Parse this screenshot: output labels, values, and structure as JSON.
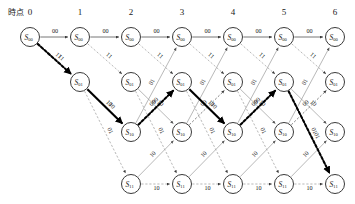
{
  "diagram": {
    "title_label": "時点",
    "type": "trellis",
    "columns": [
      "0",
      "1",
      "2",
      "3",
      "4",
      "5",
      "6"
    ],
    "column_x": [
      30,
      80,
      131,
      182,
      233,
      284,
      335
    ],
    "row_y": [
      37,
      82,
      132,
      184
    ],
    "states": [
      {
        "id": "s00",
        "base": "S",
        "sub": "00",
        "row": 0,
        "first_col": 0
      },
      {
        "id": "s01",
        "base": "S",
        "sub": "01",
        "row": 1,
        "first_col": 1
      },
      {
        "id": "s10",
        "base": "S",
        "sub": "10",
        "row": 2,
        "first_col": 2
      },
      {
        "id": "s11",
        "base": "S",
        "sub": "11",
        "row": 3,
        "first_col": 2
      }
    ],
    "edge_labels": {
      "s00_s00": "00",
      "s00_s01": "11",
      "s01_s10": "10",
      "s01_s11": "01",
      "s10_s00": "01",
      "s10_s01": "00",
      "s11_s10": "10",
      "s11_s11": "10"
    },
    "survivor_path": {
      "nodes": [
        "S00@0",
        "S01@1",
        "S10@2",
        "S01@3",
        "S10@4",
        "S01@5",
        "S11@6"
      ],
      "labels": [
        "11",
        "10",
        "00",
        "10",
        "00",
        "01"
      ],
      "styles": [
        "bold-dotted",
        "bold-solid",
        "bold-dotted",
        "bold-solid",
        "bold-dotted",
        "bold-dotted"
      ]
    },
    "colors": {
      "node_stroke": "#3a3a3a",
      "edge_dark": "#4a4a4a",
      "edge_light": "#9a9a9a",
      "highlight": "#000000",
      "background": "#ffffff"
    }
  }
}
